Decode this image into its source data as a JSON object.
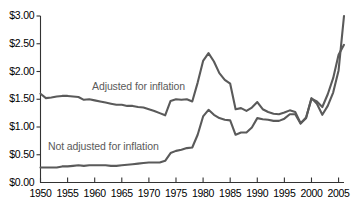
{
  "chart_data": {
    "type": "line",
    "title": "",
    "subtitle": "",
    "xlabel": "",
    "ylabel": "",
    "xlim": [
      1950,
      2006
    ],
    "ylim": [
      0,
      3.0
    ],
    "grid": false,
    "legend_position": "inline-annotation",
    "y_tick_labels": [
      "$0.00",
      "$0.50",
      "$1.00",
      "$1.50",
      "$2.00",
      "$2.50",
      "$3.00"
    ],
    "y_tick_values": [
      0,
      0.5,
      1.0,
      1.5,
      2.0,
      2.5,
      3.0
    ],
    "x_tick_labels": [
      "1950",
      "1955",
      "1960",
      "1965",
      "1970",
      "1975",
      "1980",
      "1985",
      "1990",
      "1995",
      "2000",
      "2005"
    ],
    "x_tick_values": [
      1950,
      1955,
      1960,
      1965,
      1970,
      1975,
      1980,
      1985,
      1990,
      1995,
      2000,
      2005
    ],
    "x": [
      1950,
      1951,
      1952,
      1953,
      1954,
      1955,
      1956,
      1957,
      1958,
      1959,
      1960,
      1961,
      1962,
      1963,
      1964,
      1965,
      1966,
      1967,
      1968,
      1969,
      1970,
      1971,
      1972,
      1973,
      1974,
      1975,
      1976,
      1977,
      1978,
      1979,
      1980,
      1981,
      1982,
      1983,
      1984,
      1985,
      1986,
      1987,
      1988,
      1989,
      1990,
      1991,
      1992,
      1993,
      1994,
      1995,
      1996,
      1997,
      1998,
      1999,
      2000,
      2001,
      2002,
      2003,
      2004,
      2005,
      2006
    ],
    "series": [
      {
        "name": "Adjusted for inflation",
        "color": "#5a5a5a",
        "values": [
          1.6,
          1.52,
          1.53,
          1.55,
          1.56,
          1.56,
          1.55,
          1.54,
          1.49,
          1.5,
          1.48,
          1.46,
          1.44,
          1.42,
          1.4,
          1.4,
          1.38,
          1.38,
          1.36,
          1.35,
          1.32,
          1.29,
          1.25,
          1.21,
          1.47,
          1.5,
          1.49,
          1.5,
          1.46,
          1.8,
          2.19,
          2.33,
          2.18,
          1.97,
          1.85,
          1.78,
          1.32,
          1.34,
          1.29,
          1.35,
          1.45,
          1.32,
          1.27,
          1.24,
          1.23,
          1.26,
          1.3,
          1.27,
          1.07,
          1.16,
          1.52,
          1.42,
          1.22,
          1.38,
          1.62,
          2.02,
          3.0
        ]
      },
      {
        "name": "Not adjusted for inflation",
        "color": "#5a5a5a",
        "values": [
          0.27,
          0.27,
          0.27,
          0.27,
          0.29,
          0.29,
          0.3,
          0.31,
          0.3,
          0.31,
          0.31,
          0.31,
          0.31,
          0.3,
          0.3,
          0.31,
          0.32,
          0.33,
          0.34,
          0.35,
          0.36,
          0.36,
          0.36,
          0.39,
          0.53,
          0.57,
          0.59,
          0.62,
          0.63,
          0.86,
          1.19,
          1.31,
          1.22,
          1.16,
          1.13,
          1.12,
          0.86,
          0.9,
          0.9,
          0.99,
          1.16,
          1.14,
          1.13,
          1.11,
          1.11,
          1.15,
          1.23,
          1.23,
          1.06,
          1.17,
          1.51,
          1.46,
          1.36,
          1.59,
          1.88,
          2.3,
          2.48
        ]
      }
    ],
    "annotations": [
      {
        "text": "Adjusted for inflation",
        "series": "Adjusted for inflation"
      },
      {
        "text": "Not adjusted for inflation",
        "series": "Not adjusted for inflation"
      }
    ],
    "axis_color": "#333333",
    "background_color": "#ffffff"
  }
}
